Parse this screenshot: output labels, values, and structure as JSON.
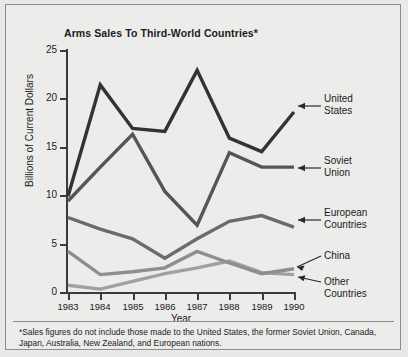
{
  "chart_data": {
    "type": "line",
    "title": "Arms Sales To Third-World Countries*",
    "xlabel": "Year",
    "ylabel": "Billions of Current Dollars",
    "x": [
      1983,
      1984,
      1985,
      1986,
      1987,
      1988,
      1989,
      1990
    ],
    "xticklabels": [
      "1983",
      "1984",
      "1985",
      "1986",
      "1987",
      "1988",
      "1989",
      "1990"
    ],
    "yticklabels": [
      "0",
      "5",
      "10",
      "15",
      "20",
      "25"
    ],
    "ylim": [
      0,
      25
    ],
    "yticks": [
      0,
      5,
      10,
      15,
      20,
      25
    ],
    "grid": false,
    "legend_position": "right-annotated-arrows",
    "series": [
      {
        "name": "United States",
        "color": "#333333",
        "values": [
          10.0,
          21.5,
          17.0,
          16.7,
          23.0,
          16.0,
          14.6,
          18.7
        ]
      },
      {
        "name": "Soviet Union",
        "color": "#555555",
        "values": [
          9.5,
          13.0,
          16.4,
          10.5,
          7.0,
          14.5,
          13.0,
          13.0
        ]
      },
      {
        "name": "European Countries",
        "color": "#6b6b6b",
        "values": [
          7.8,
          6.6,
          5.6,
          3.6,
          5.6,
          7.4,
          8.0,
          6.8
        ]
      },
      {
        "name": "China",
        "color": "#8e8e8e",
        "values": [
          4.3,
          1.9,
          2.2,
          2.6,
          4.3,
          3.1,
          2.0,
          2.5
        ]
      },
      {
        "name": "Other Countries",
        "color": "#a0a0a0",
        "values": [
          0.8,
          0.4,
          1.2,
          2.0,
          2.6,
          3.3,
          2.1,
          1.9
        ]
      }
    ],
    "annotations": [
      {
        "label": "United States",
        "line1": "United",
        "line2": "States"
      },
      {
        "label": "Soviet Union",
        "line1": "Soviet",
        "line2": "Union"
      },
      {
        "label": "European Countries",
        "line1": "European",
        "line2": "Countries"
      },
      {
        "label": "China",
        "line1": "China",
        "line2": ""
      },
      {
        "label": "Other Countries",
        "line1": "Other",
        "line2": "Countries"
      }
    ],
    "footnote": "*Sales figures do not include those made to the United States, the former Soviet Union, Canada, Japan, Australia, New Zealand, and European nations."
  },
  "colors": {
    "background": "#ececeb",
    "frame": "#8c8c8c",
    "axis": "#3a3a3a",
    "text": "#1b1b1b"
  }
}
